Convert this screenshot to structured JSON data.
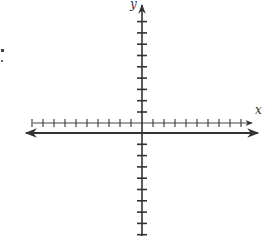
{
  "diagram": {
    "type": "coordinate-plane",
    "axes": {
      "x_label": "x",
      "y_label": "y",
      "x_ticks_left": 10,
      "x_ticks_right": 9,
      "y_ticks_above": 9,
      "y_ticks_below": 9
    },
    "colors": {
      "axis": "#333333",
      "background": "#ffffff"
    },
    "stray_mark": ":"
  }
}
